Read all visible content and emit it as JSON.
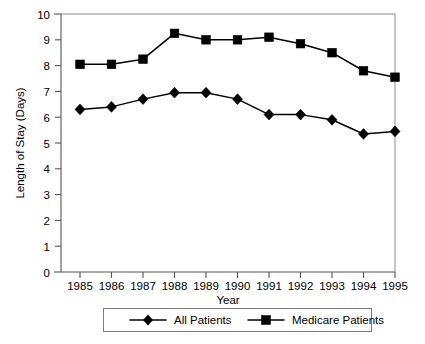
{
  "chart_data": {
    "type": "line",
    "title": "",
    "xlabel": "Year",
    "ylabel": "Length of Stay (Days)",
    "categories": [
      "1985",
      "1986",
      "1987",
      "1988",
      "1989",
      "1990",
      "1991",
      "1992",
      "1993",
      "1994",
      "1995"
    ],
    "x": [
      1985,
      1986,
      1987,
      1988,
      1989,
      1990,
      1991,
      1992,
      1993,
      1994,
      1995
    ],
    "series": [
      {
        "name": "All Patients",
        "marker": "diamond",
        "color": "#000000",
        "values": [
          6.3,
          6.4,
          6.7,
          6.95,
          6.95,
          6.7,
          6.1,
          6.1,
          5.9,
          5.35,
          5.45
        ]
      },
      {
        "name": "Medicare Patients",
        "marker": "square",
        "color": "#000000",
        "values": [
          8.05,
          8.05,
          8.25,
          9.25,
          9.0,
          9.0,
          9.1,
          8.85,
          8.5,
          7.8,
          7.55
        ]
      }
    ],
    "ylim": [
      0,
      10
    ],
    "ytick_values": [
      "0",
      "1",
      "2",
      "3",
      "4",
      "5",
      "6",
      "7",
      "8",
      "9",
      "10"
    ],
    "ytick_step": 1,
    "xlim": [
      1984.5,
      1995.5
    ],
    "grid": false,
    "legend_position": "below-axis-centered",
    "frame": "box"
  },
  "axes": {
    "y_axis_title": "Length of Stay (Days)",
    "x_axis_title": "Year"
  },
  "legend": {
    "entries": [
      {
        "label": "All Patients",
        "marker": "diamond"
      },
      {
        "label": "Medicare Patients",
        "marker": "square"
      }
    ]
  }
}
